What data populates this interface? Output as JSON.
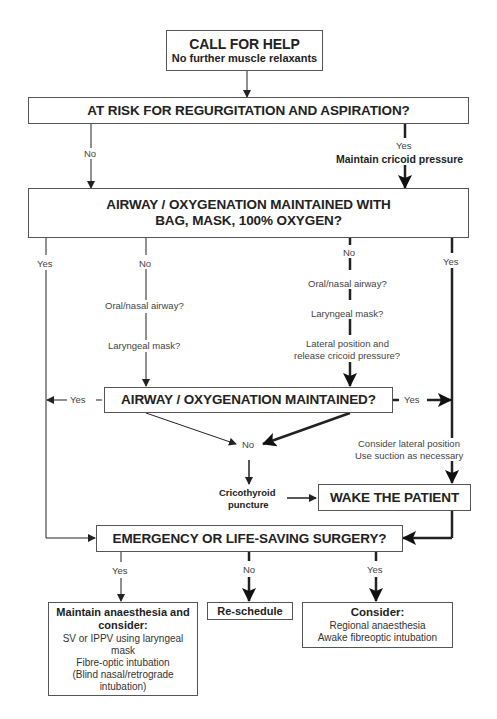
{
  "diagram": {
    "type": "flowchart",
    "nodes": {
      "call_for_help": {
        "title": "CALL FOR HELP",
        "subtitle": "No further muscle relaxants"
      },
      "risk": {
        "title": "AT RISK FOR REGURGITATION AND ASPIRATION?"
      },
      "bag_mask": {
        "line1": "AIRWAY / OXYGENATION MAINTAINED WITH",
        "line2": "BAG, MASK, 100% OXYGEN?"
      },
      "maintained": {
        "title": "AIRWAY / OXYGENATION MAINTAINED?"
      },
      "wake": {
        "title": "WAKE THE PATIENT"
      },
      "emergency": {
        "title": "EMERGENCY OR LIFE-SAVING SURGERY?"
      },
      "maintain_anaesthesia": {
        "title1": "Maintain anaesthesia and",
        "title2": "consider:",
        "items": [
          "SV or IPPV using laryngeal",
          "mask",
          "Fibre-optic intubation",
          "(Blind nasal/retrograde",
          "intubation)"
        ]
      },
      "reschedule": {
        "title": "Re-schedule"
      },
      "consider": {
        "title": "Consider:",
        "items": [
          "Regional anaesthesia",
          "Awake fibreoptic intubation"
        ]
      }
    },
    "labels": {
      "risk_no": "No",
      "risk_yes": "Yes",
      "cricoid": "Maintain cricoid pressure",
      "bag_yes_left": "Yes",
      "bag_no_left": "No",
      "oral_nasal_left": "Oral/nasal airway?",
      "laryngeal_left": "Laryngeal mask?",
      "bag_no_right": "No",
      "oral_nasal_right": "Oral/nasal airway?",
      "laryngeal_right": "Laryngeal mask?",
      "lateral1": "Lateral position and",
      "lateral2": "release cricoid pressure?",
      "bag_yes_right": "Yes",
      "maintained_yes_left": "Yes",
      "maintained_yes_right": "Yes",
      "maintained_no": "No",
      "consider_lateral1": "Consider lateral position",
      "consider_lateral2": "Use suction as necessary",
      "crico1": "Cricothyroid",
      "crico2": "puncture",
      "emerg_yes_left": "Yes",
      "emerg_no": "No",
      "emerg_yes_right": "Yes"
    },
    "colors": {
      "line": "#222222",
      "box_border": "#555555",
      "background": "#ffffff"
    }
  }
}
